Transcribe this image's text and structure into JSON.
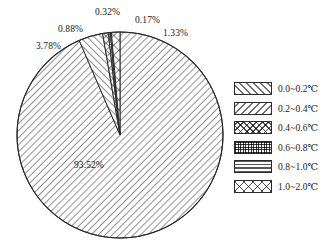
{
  "chart_data": {
    "type": "pie",
    "title": "",
    "categories": [
      "0.0~0.2℃",
      "0.2~0.4℃",
      "0.4~0.6℃",
      "0.6~0.8℃",
      "0.8~1.0℃",
      "1.0~2.0℃"
    ],
    "values": [
      93.52,
      3.78,
      0.88,
      0.32,
      0.17,
      1.33
    ],
    "value_labels": [
      "93.52%",
      "3.78%",
      "0.88%",
      "0.32%",
      "0.17%",
      "1.33%"
    ],
    "units": "percent",
    "legend_position": "right",
    "grid": false,
    "patterns": [
      "forward-diagonal",
      "backward-diagonal",
      "diagonal-cross",
      "fine-grid",
      "horizontal-lines",
      "coarse-diagonal-cross"
    ],
    "stroke_color": "#2b2b2b",
    "fill_color": "#ffffff",
    "text_color": "#1a1a1a",
    "start_angle_deg": -90,
    "direction": "clockwise"
  },
  "legend": {
    "items": [
      {
        "label": "0.0~0.2℃",
        "pattern": "forward-diagonal"
      },
      {
        "label": "0.2~0.4℃",
        "pattern": "backward-diagonal"
      },
      {
        "label": "0.4~0.6℃",
        "pattern": "diagonal-cross"
      },
      {
        "label": "0.6~0.8℃",
        "pattern": "fine-grid"
      },
      {
        "label": "0.8~1.0℃",
        "pattern": "horizontal-lines"
      },
      {
        "label": "1.0~2.0℃",
        "pattern": "coarse-diagonal-cross"
      }
    ]
  },
  "pie_labels": {
    "main": "93.52%",
    "left_outer": "3.78%",
    "left_inner": "0.88%",
    "top_center": "0.32%",
    "top_right_inner": "0.17%",
    "top_right_outer": "1.33%"
  }
}
